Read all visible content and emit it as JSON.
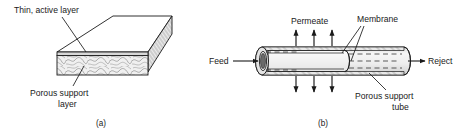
{
  "figure": {
    "panel_a": {
      "caption": "(a)",
      "labels": {
        "top": "Thin, active layer",
        "bottom_line1": "Porous support",
        "bottom_line2": "layer"
      }
    },
    "panel_b": {
      "caption": "(b)",
      "labels": {
        "permeate": "Permeate",
        "membrane": "Membrane",
        "feed": "Feed",
        "reject": "Reject",
        "support_line1": "Porous support",
        "support_line2": "tube"
      }
    },
    "colors": {
      "stroke": "#1a1a1a",
      "fill_light": "#f2f2f2",
      "fill_mid": "#e2e2e2",
      "fill_dark": "#6a6a6a",
      "background": "#ffffff"
    }
  }
}
